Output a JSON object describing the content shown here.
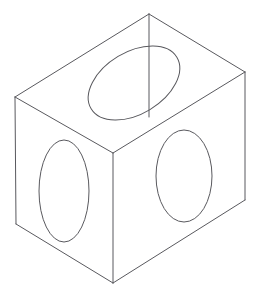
{
  "document": {
    "title": "Isometric Wireframe Box with Three Circular Holes",
    "background_color": "#ffffff",
    "canvas_width": 263,
    "canvas_height": 297
  },
  "drawing": {
    "type": "isometric-wireframe",
    "line_color": "#59595e",
    "line_width": 1,
    "hole_line_color": "#59595e",
    "hole_line_width": 1,
    "description": "Transparent rectangular prism drawn in isometric projection with an elliptical (circular) hole on the top face, the left front face and the right front face.",
    "vertices": {
      "top_back": {
        "x": 149,
        "y": 14,
        "label": "top-back-corner"
      },
      "top_left": {
        "x": 15,
        "y": 97,
        "label": "top-left-corner"
      },
      "top_right": {
        "x": 245,
        "y": 72,
        "label": "top-right-corner"
      },
      "top_front": {
        "x": 113,
        "y": 153,
        "label": "top-front-corner"
      },
      "bottom_left": {
        "x": 16,
        "y": 224,
        "label": "bottom-left-corner"
      },
      "bottom_front": {
        "x": 113,
        "y": 283,
        "label": "bottom-front-corner"
      },
      "bottom_right": {
        "x": 245,
        "y": 200,
        "label": "bottom-right-corner"
      },
      "back_hidden": {
        "x": 149,
        "y": 117,
        "label": "back-hidden-corner"
      }
    },
    "edges": [
      {
        "name": "top-face-back-left",
        "d": "M 15 97 L 149 14"
      },
      {
        "name": "top-face-back-right",
        "d": "M 149 14 L 245 72"
      },
      {
        "name": "top-face-front-right",
        "d": "M 245 72 L 113 153"
      },
      {
        "name": "top-face-front-left",
        "d": "M 113 153 L 15 97"
      },
      {
        "name": "vertical-left-edge",
        "d": "M 15 97 L 16 224"
      },
      {
        "name": "vertical-front-edge",
        "d": "M 113 153 L 113 283"
      },
      {
        "name": "vertical-right-edge",
        "d": "M 245 72 L 245 200"
      },
      {
        "name": "bottom-face-left",
        "d": "M 16 224 L 113 283"
      },
      {
        "name": "bottom-face-right",
        "d": "M 113 283 L 245 200"
      },
      {
        "name": "back-hidden-vertical-edge",
        "d": "M 149 14 L 149 117"
      }
    ],
    "holes": [
      {
        "name": "top-face-hole",
        "face": "top",
        "center_x": 134,
        "center_y": 83,
        "radius_x": 50,
        "radius_y": 31,
        "rotation_deg": -31
      },
      {
        "name": "left-face-hole",
        "face": "left-front",
        "center_x": 64,
        "center_y": 191,
        "radius_x": 25,
        "radius_y": 51,
        "rotation_deg": 0
      },
      {
        "name": "right-face-hole",
        "face": "right-front",
        "center_x": 184,
        "center_y": 176,
        "radius_x": 28,
        "radius_y": 46,
        "rotation_deg": 0
      }
    ]
  }
}
